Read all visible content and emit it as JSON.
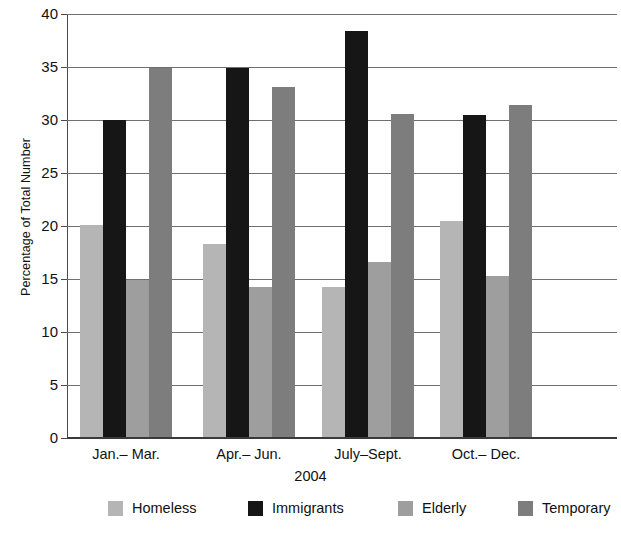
{
  "chart_data": {
    "type": "bar",
    "title": "",
    "xlabel": "2004",
    "ylabel": "Percentage of Total Number",
    "categories": [
      "Jan.– Mar.",
      "Apr.– Jun.",
      "July–Sept.",
      "Oct.– Dec."
    ],
    "series": [
      {
        "name": "Homeless",
        "color": "#b5b5b5",
        "values": [
          20.1,
          18.3,
          14.2,
          20.5
        ]
      },
      {
        "name": "Immigrants",
        "color": "#161616",
        "values": [
          30.0,
          34.9,
          38.4,
          30.5
        ]
      },
      {
        "name": "Elderly",
        "color": "#9e9e9e",
        "values": [
          14.9,
          14.2,
          16.6,
          15.3
        ]
      },
      {
        "name": "Temporary",
        "color": "#7d7d7d",
        "values": [
          34.9,
          33.1,
          30.6,
          31.4
        ]
      }
    ],
    "ylim": [
      0,
      40
    ],
    "yticks": [
      0,
      5,
      10,
      15,
      20,
      25,
      30,
      35,
      40
    ],
    "ytick_labels": [
      "0",
      "5",
      "10",
      "15",
      "20",
      "25",
      "30",
      "35",
      "40"
    ],
    "grid": true,
    "legend_position": "bottom"
  },
  "legend": {
    "items": [
      {
        "label": "Homeless",
        "color": "#b5b5b5"
      },
      {
        "label": "Immigrants",
        "color": "#161616"
      },
      {
        "label": "Elderly",
        "color": "#9e9e9e"
      },
      {
        "label": "Temporary",
        "color": "#7d7d7d"
      }
    ]
  }
}
